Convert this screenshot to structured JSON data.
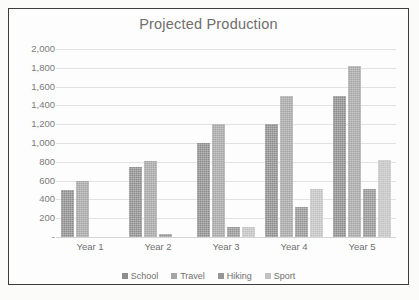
{
  "chart_data": {
    "type": "bar",
    "title": "Projected Production",
    "xlabel": "",
    "ylabel": "",
    "categories": [
      "Year 1",
      "Year 2",
      "Year 3",
      "Year 4",
      "Year 5"
    ],
    "series": [
      {
        "name": "School",
        "color": "#8d8d8d",
        "values": [
          500,
          750,
          1000,
          1200,
          1500
        ]
      },
      {
        "name": "Travel",
        "color": "#a5a5a5",
        "values": [
          600,
          810,
          1200,
          1500,
          1820
        ]
      },
      {
        "name": "Hiking",
        "color": "#959595",
        "values": [
          null,
          30,
          110,
          320,
          510
        ]
      },
      {
        "name": "Sport",
        "color": "#c2c2c2",
        "values": [
          null,
          null,
          110,
          510,
          820
        ]
      }
    ],
    "ylim": [
      0,
      2000
    ],
    "ytick_labels": [
      "2,000",
      "1,800",
      "1,600",
      "1,400",
      "1,200",
      "1,000",
      "800",
      "600",
      "400",
      "200",
      "-"
    ],
    "ytick_values": [
      2000,
      1800,
      1600,
      1400,
      1200,
      1000,
      800,
      600,
      400,
      200,
      0
    ],
    "grid": true,
    "legend_position": "bottom"
  }
}
